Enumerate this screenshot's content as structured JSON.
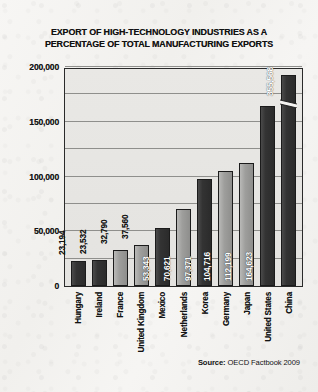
{
  "chart_data": {
    "type": "bar",
    "title": "EXPORT OF HIGH-TECHNOLOGY INDUSTRIES AS A PERCENTAGE OF TOTAL MANUFACTURING EXPORTS",
    "title_line1": "EXPORT OF HIGH-TECHNOLOGY INDUSTRIES AS A",
    "title_line2": "PERCENTAGE OF TOTAL MANUFACTURING EXPORTS",
    "xlabel": "",
    "ylabel": "",
    "ylim": [
      0,
      200000
    ],
    "grid": true,
    "gridline_interval": 25000,
    "legend": "none",
    "axis_break": {
      "present": true,
      "category": "China",
      "note": "China bar truncated with zigzag break near top of axis"
    },
    "categories": [
      "Hungary",
      "Ireland",
      "France",
      "United Kingdom",
      "Mexico",
      "Netherlands",
      "Korea",
      "Germany",
      "Japan",
      "United States",
      "China"
    ],
    "values": [
      23194,
      23532,
      32790,
      37560,
      53343,
      70621,
      97371,
      104716,
      112199,
      164623,
      355568
    ],
    "value_labels": [
      "23,194",
      "23,532",
      "32,790",
      "37,560",
      "53,343",
      "70,621",
      "97,371",
      "104,716",
      "112,199",
      "164,623",
      "355,568"
    ],
    "bar_shades": [
      "dark",
      "dark",
      "light",
      "light",
      "dark",
      "light",
      "dark",
      "light",
      "light",
      "dark",
      "dark"
    ],
    "yticks": [
      0,
      50000,
      100000,
      150000,
      200000
    ],
    "ytick_labels": [
      "0",
      "50,000",
      "100,000",
      "150,000",
      "200,000"
    ],
    "colors": {
      "bar_dark": "#2b2b2b",
      "bar_light": "#9e9e9c",
      "plot_background": "#e7e6e3",
      "page_background": "#f4f3f1",
      "axis": "#2a2a2a",
      "gridline": "#8f8f8c",
      "text": "#141414",
      "value_label": "#ffffff"
    }
  },
  "source": {
    "prefix": "Source:",
    "text": "OECD Factbook 2009"
  }
}
